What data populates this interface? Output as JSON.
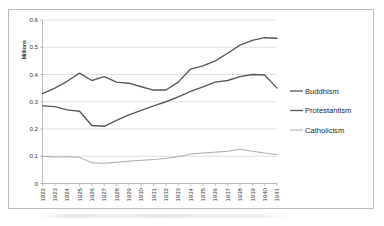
{
  "chart_data": {
    "type": "line",
    "title": "",
    "subtitle": "",
    "xlabel": "",
    "ylabel": "Millions",
    "ylim": [
      0,
      0.6
    ],
    "ytick_labels": [
      "0",
      "0.1",
      "0.2",
      "0.3",
      "0.4",
      "0.5",
      "0.6"
    ],
    "ytick_values": [
      0,
      0.1,
      0.2,
      0.3,
      0.4,
      0.5,
      0.6
    ],
    "grid": "horizontal",
    "legend_position": "right",
    "categories": [
      "1922",
      "1923",
      "1924",
      "1925",
      "1926",
      "1927",
      "1928",
      "1929",
      "1930",
      "1931",
      "1932",
      "1933",
      "1934",
      "1935",
      "1936",
      "1937",
      "1938",
      "1939",
      "1940",
      "1941"
    ],
    "x": [
      "1922",
      "1923",
      "1924",
      "1925",
      "1926",
      "1927",
      "1928",
      "1929",
      "1930",
      "1931",
      "1932",
      "1933",
      "1934",
      "1935",
      "1936",
      "1937",
      "1938",
      "1939",
      "1940",
      "1941"
    ],
    "series": [
      {
        "name": "Buddhism",
        "color": "#595959",
        "values": [
          0.33,
          0.35,
          0.375,
          0.405,
          0.378,
          0.392,
          0.372,
          0.368,
          0.355,
          0.343,
          0.343,
          0.372,
          0.42,
          0.432,
          0.45,
          0.478,
          0.508,
          0.525,
          0.535,
          0.533
        ]
      },
      {
        "name": "Protestantism",
        "color": "#595959",
        "values": [
          0.285,
          0.282,
          0.27,
          0.265,
          0.213,
          0.21,
          0.232,
          0.252,
          0.268,
          0.285,
          0.3,
          0.318,
          0.338,
          0.355,
          0.372,
          0.378,
          0.392,
          0.4,
          0.398,
          0.35
        ]
      },
      {
        "name": "Catholicism",
        "color": "#a6a6a6",
        "values": [
          0.1,
          0.097,
          0.098,
          0.096,
          0.076,
          0.074,
          0.078,
          0.082,
          0.085,
          0.088,
          0.092,
          0.098,
          0.108,
          0.112,
          0.115,
          0.118,
          0.126,
          0.118,
          0.112,
          0.106
        ]
      }
    ]
  },
  "legend": {
    "items": [
      {
        "label": "Buddhism",
        "color": "#595959"
      },
      {
        "label": "Protestantism",
        "color": "#595959"
      },
      {
        "label": "Catholicism",
        "color": "#a6a6a6"
      }
    ]
  },
  "axes": {
    "y_axis_title": "Millions"
  }
}
